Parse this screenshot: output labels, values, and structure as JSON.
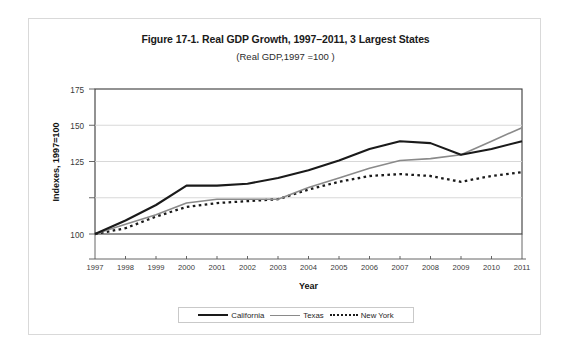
{
  "figure": {
    "title": "Figure 17-1. Real GDP Growth, 1997–2011, 3 Largest States",
    "subtitle": "(Real GDP,1997 =100 )"
  },
  "chart_data": {
    "type": "line",
    "title": "Figure 17-1. Real GDP Growth, 1997–2011, 3 Largest States",
    "subtitle": "(Real GDP,1997 =100 )",
    "xlabel": "Year",
    "ylabel": "Indexes, 1997=100",
    "categories": [
      "1997",
      "1998",
      "1999",
      "2000",
      "2001",
      "2002",
      "2003",
      "2004",
      "2005",
      "2006",
      "2007",
      "2008",
      "2009",
      "2010",
      "2011"
    ],
    "x": [
      1997,
      1998,
      1999,
      2000,
      2001,
      2002,
      2003,
      2004,
      2005,
      2006,
      2007,
      2008,
      2009,
      2010,
      2011
    ],
    "ylim": [
      75,
      175
    ],
    "yticks": [
      100,
      125,
      150,
      175
    ],
    "ytick_labels": [
      "100",
      "125",
      "150",
      "175"
    ],
    "grid": "horizontal",
    "legend_position": "bottom",
    "series": [
      {
        "name": "California",
        "style": "solid",
        "color": "#1a1a1a",
        "width": 2.1,
        "values": [
          100,
          107,
          115,
          125,
          125,
          126,
          129,
          133,
          138,
          144,
          148,
          147,
          141,
          144,
          148
        ]
      },
      {
        "name": "Texas",
        "style": "solid",
        "color": "#8a8a8a",
        "width": 1.6,
        "values": [
          100,
          105,
          110,
          116,
          118,
          118,
          118,
          124,
          129,
          134,
          138,
          139,
          141,
          148,
          155
        ]
      },
      {
        "name": "New York",
        "style": "dotted",
        "color": "#1a1a1a",
        "width": 2.3,
        "values": [
          100,
          103,
          109,
          114,
          116,
          117,
          118,
          123,
          127,
          130,
          131,
          130,
          127,
          130,
          132
        ]
      }
    ]
  },
  "axes": {
    "y_title": "Indexes, 1997=100",
    "x_title": "Year",
    "y_ticks": [
      "175",
      "150",
      "125",
      "100"
    ],
    "x_ticks": [
      "1997",
      "1998",
      "1999",
      "2000",
      "2001",
      "2002",
      "2003",
      "2004",
      "2005",
      "2006",
      "2007",
      "2008",
      "2009",
      "2010",
      "2011"
    ]
  },
  "legend": {
    "items": [
      {
        "label": "California",
        "marker": "solid-thick-black-line-swatch"
      },
      {
        "label": "Texas",
        "marker": "solid-gray-line-swatch"
      },
      {
        "label": "New York",
        "marker": "dotted-black-line-swatch"
      }
    ]
  }
}
